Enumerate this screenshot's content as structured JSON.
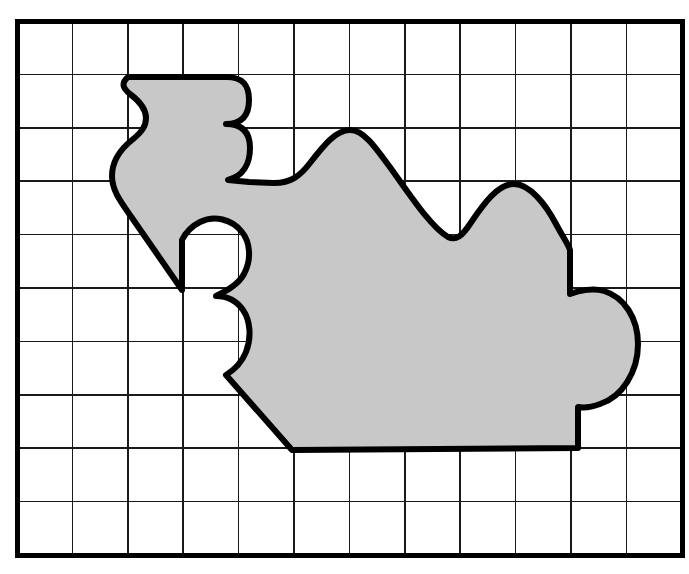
{
  "figure": {
    "background_color": "#ffffff",
    "shape_fill_color": "#c8c8c8",
    "shape_stroke_color": "#000000",
    "grid_line_color": "#1a1a1a",
    "grid_border_color": "#000000"
  },
  "grid": {
    "columns": 12,
    "rows": 10,
    "left": 17,
    "top": 21,
    "right": 682,
    "bottom": 555,
    "cell_width": 55.4,
    "cell_height": 53.4,
    "border_stroke_width": 5,
    "line_stroke_width": 1.6
  },
  "chart_data": {
    "type": "area",
    "xlabel": "",
    "ylabel": "",
    "grid": true,
    "legend": "none",
    "x_axis_cells": 12,
    "y_axis_cells": 10,
    "series": [
      {
        "name": "shaded-region",
        "fill": "#c8c8c8",
        "stroke": "#000000",
        "key_vertices_px": [
          [
            128,
            77
          ],
          [
            245,
            77
          ],
          [
            245,
            131
          ],
          [
            247,
            183
          ],
          [
            350,
            131
          ],
          [
            458,
            239
          ],
          [
            516,
            186
          ],
          [
            570,
            239
          ],
          [
            570,
            292
          ],
          [
            630,
            340
          ],
          [
            630,
            400
          ],
          [
            577,
            451
          ],
          [
            290,
            451
          ],
          [
            181,
            290
          ],
          [
            245,
            295
          ],
          [
            230,
            375
          ],
          [
            181,
            290
          ],
          [
            117,
            185
          ],
          [
            117,
            130
          ]
        ],
        "approx_area_cells": 36
      }
    ]
  },
  "shape_path": "M 128 77 L 226 77 C 244 77 249 86 249 100 C 249 114 243 124 226 124 C 243 124 250 133 250 148 C 250 164 243 176 228 180 L 249 182 L 274 183 C 291 183 300 176 310 163 C 324 145 336 130 350 130 C 364 130 376 148 392 170 C 412 198 432 228 448 237 C 456 241 462 236 470 224 C 484 203 498 184 514 184 C 530 184 546 205 556 224 C 564 239 568 244 570 250 L 570 294 C 580 290 594 288 604 291 C 624 297 638 318 638 344 C 638 372 622 397 600 404 C 592 407 584 408 578 407 L 578 448 L 292 450 L 226 375 C 234 370 242 362 246 352 C 252 337 250 320 243 310 C 236 300 226 296 216 296 C 226 291 238 285 244 274 C 252 259 250 242 242 232 C 232 219 214 215 200 222 C 192 226 186 232 182 240 L 182 290 L 130 215 C 120 201 112 190 112 176 C 112 160 122 148 132 140 C 142 132 146 126 146 118 C 146 108 138 100 130 94 C 124 89 120 84 128 77 Z"
}
